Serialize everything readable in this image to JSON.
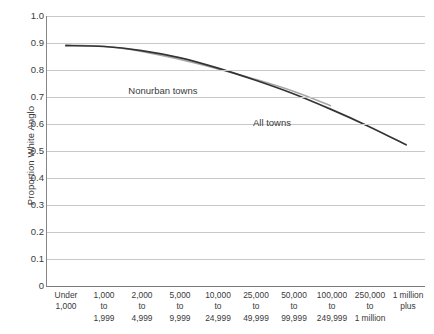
{
  "chart_data": {
    "type": "line",
    "title": "",
    "xlabel": "",
    "ylabel": "Proportion White Anglo",
    "ylim": [
      0,
      1.0
    ],
    "ytick_step": 0.1,
    "grid": true,
    "legend": "inline-annotations",
    "categories": [
      "Under 1,000",
      "1,000 to 1,999",
      "2,000 to 4,999",
      "5,000 to 9,999",
      "10,000 to 24,999",
      "25,000 to 49,999",
      "50,000 to 99,999",
      "100,000 to 249,999",
      "250,000 to 1 million",
      "1 million plus"
    ],
    "category_lines": [
      [
        "Under",
        "1,000",
        ""
      ],
      [
        "1,000",
        "to",
        "1,999"
      ],
      [
        "2,000",
        "to",
        "4,999"
      ],
      [
        "5,000",
        "to",
        "9,999"
      ],
      [
        "10,000",
        "to",
        "24,999"
      ],
      [
        "25,000",
        "to",
        "49,999"
      ],
      [
        "50,000",
        "to",
        "99,999"
      ],
      [
        "100,000",
        "to",
        "249,999"
      ],
      [
        "250,000",
        "to",
        "1 million"
      ],
      [
        "1 million",
        "plus",
        ""
      ]
    ],
    "ytick_labels": [
      "1.0",
      "0.9",
      "0.8",
      "0.7",
      "0.6",
      "0.5",
      "0.4",
      "0.3",
      "0.2",
      "0.1",
      "0"
    ],
    "ytick_values": [
      1.0,
      0.9,
      0.8,
      0.7,
      0.6,
      0.5,
      0.4,
      0.3,
      0.2,
      0.1,
      0
    ],
    "series": [
      {
        "name": "All towns",
        "color": "#333333",
        "values": [
          0.89,
          0.887,
          0.872,
          0.846,
          0.808,
          0.763,
          0.713,
          0.655,
          0.592,
          0.523
        ]
      },
      {
        "name": "Nonurban towns",
        "color": "#a8a8a8",
        "values": [
          0.892,
          0.888,
          0.869,
          0.84,
          0.805,
          0.766,
          0.722,
          0.668,
          null,
          null
        ]
      }
    ],
    "annotations": [
      {
        "text": "Nonurban towns",
        "x_frac": 0.215,
        "y_frac": 0.255
      },
      {
        "text": "All towns",
        "x_frac": 0.545,
        "y_frac": 0.375
      }
    ]
  },
  "caption": ""
}
